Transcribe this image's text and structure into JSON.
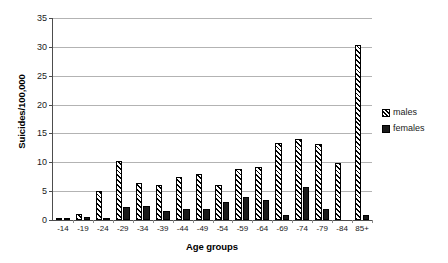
{
  "chart_data": {
    "type": "bar",
    "title": "",
    "xlabel": "Age groups",
    "ylabel": "Suicides/100,000",
    "ylim": [
      0,
      35
    ],
    "yticks": [
      0,
      5,
      10,
      15,
      20,
      25,
      30,
      35
    ],
    "grid": true,
    "legend_position": "right",
    "categories": [
      "-14",
      "-19",
      "-24",
      "-29",
      "-34",
      "-39",
      "-44",
      "-49",
      "-54",
      "-59",
      "-64",
      "-69",
      "-74",
      "-79",
      "-84",
      "85+"
    ],
    "series": [
      {
        "name": "males",
        "pattern": "diagonal-hatch",
        "color": "#000000",
        "values": [
          0.3,
          1.0,
          5.0,
          10.3,
          6.4,
          6.1,
          7.4,
          7.9,
          6.0,
          8.8,
          9.2,
          13.4,
          14.0,
          13.2,
          9.9,
          30.3
        ]
      },
      {
        "name": "females",
        "pattern": "solid",
        "color": "#1a1a1a",
        "values": [
          0.3,
          0.6,
          0.3,
          2.2,
          2.5,
          1.6,
          1.9,
          1.9,
          3.1,
          4.0,
          3.4,
          0.9,
          5.8,
          1.9,
          0.0,
          0.9
        ]
      }
    ]
  },
  "legend": {
    "items": [
      {
        "label": "males",
        "swatch": "hatched-square-icon"
      },
      {
        "label": "females",
        "swatch": "filled-square-icon"
      }
    ]
  },
  "axes": {
    "y_title": "Suicides/100,000",
    "x_title": "Age groups"
  }
}
